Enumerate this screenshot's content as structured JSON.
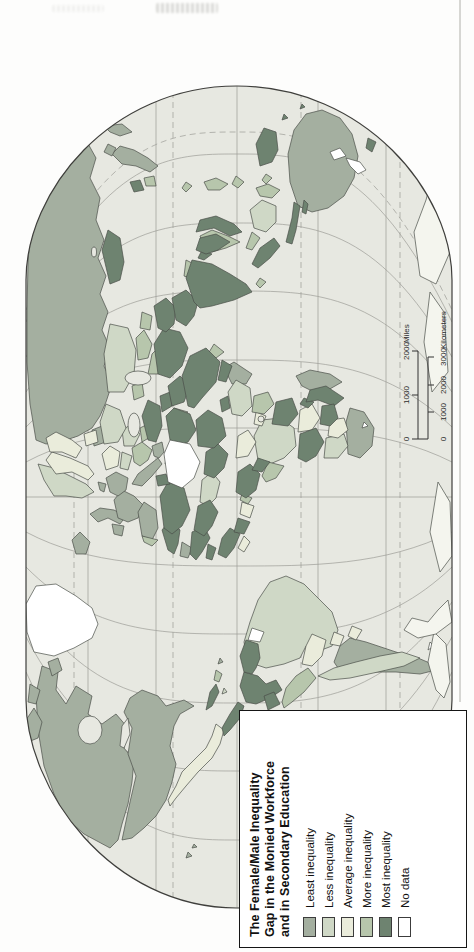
{
  "map": {
    "legend": {
      "title_lines": [
        "The Female/Male Inequality",
        "Gap in the Monied Workforce",
        "and in Secondary Education"
      ],
      "items": [
        {
          "label": "Least inequality",
          "color": "#a4afa0"
        },
        {
          "label": "Less inequality",
          "color": "#cfd8c6"
        },
        {
          "label": "Average inequality",
          "color": "#eaecdb"
        },
        {
          "label": "More inequality",
          "color": "#b7c6ac"
        },
        {
          "label": "Most inequality",
          "color": "#6e8370"
        },
        {
          "label": "No data",
          "color": "#ffffff"
        }
      ]
    },
    "scale_bar": {
      "miles": {
        "labels": [
          "0",
          "1000",
          "2000"
        ],
        "unit": "Miles"
      },
      "kilometers": {
        "labels": [
          "0",
          "1000",
          "2000",
          "3000"
        ],
        "unit": "Kilometers"
      }
    },
    "palette": {
      "least": "#a4afa0",
      "less": "#cfd8c6",
      "average": "#eaecdb",
      "more": "#b7c6ac",
      "most": "#6e8370",
      "nodata": "#ffffff",
      "antarctica": "#f4f5ee",
      "ocean": "#e7e8e1",
      "graticule": "#9c9c97",
      "border": "#4b4f49",
      "frame": "#3f3f3c",
      "page_rule": "#b0b0aa"
    }
  }
}
